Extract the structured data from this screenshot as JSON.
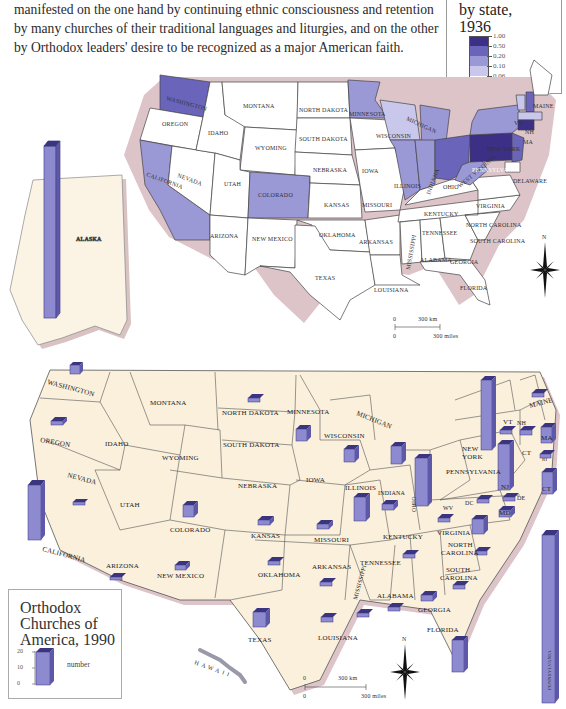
{
  "intro_text": [
    "manifested on the one hand by continuing ethnic consciousness and retention",
    "by many churches of their traditional languages and liturgies, and on the other",
    "by Orthodox leaders' desire to be recognized as a major American faith."
  ],
  "map_1936": {
    "legend": {
      "title_line1": "by state,",
      "title_line2": "1936",
      "breaks": [
        "1.00",
        "0.50",
        "0.20",
        "0.10",
        "0.06",
        "0.00"
      ],
      "colors": [
        "#3b2f86",
        "#6a64bb",
        "#9b98d6",
        "#c9c8ec",
        "#ffffff"
      ]
    },
    "states": [
      {
        "name": "WASHINGTON",
        "class": "0.50-1.00"
      },
      {
        "name": "OREGON",
        "class": "0.00-0.06"
      },
      {
        "name": "CALIFORNIA",
        "class": "0.20-0.50"
      },
      {
        "name": "NEVADA",
        "class": "0.00-0.06"
      },
      {
        "name": "IDAHO",
        "class": "0.00-0.06"
      },
      {
        "name": "MONTANA",
        "class": "0.00-0.06"
      },
      {
        "name": "WYOMING",
        "class": "0.00-0.06"
      },
      {
        "name": "UTAH",
        "class": "0.00-0.06"
      },
      {
        "name": "ARIZONA",
        "class": "0.00-0.06"
      },
      {
        "name": "NEW MEXICO",
        "class": "0.00-0.06"
      },
      {
        "name": "COLORADO",
        "class": "0.10-0.20"
      },
      {
        "name": "NORTH DAKOTA",
        "class": "0.00-0.06"
      },
      {
        "name": "SOUTH DAKOTA",
        "class": "0.00-0.06"
      },
      {
        "name": "NEBRASKA",
        "class": "0.00-0.06"
      },
      {
        "name": "KANSAS",
        "class": "0.00-0.06"
      },
      {
        "name": "OKLAHOMA",
        "class": "0.00-0.06"
      },
      {
        "name": "TEXAS",
        "class": "0.00-0.06"
      },
      {
        "name": "MINNESOTA",
        "class": "0.10-0.20"
      },
      {
        "name": "IOWA",
        "class": "0.00-0.06"
      },
      {
        "name": "MISSOURI",
        "class": "0.00-0.06"
      },
      {
        "name": "ARKANSAS",
        "class": "0.00-0.06"
      },
      {
        "name": "LOUISIANA",
        "class": "0.00-0.06"
      },
      {
        "name": "WISCONSIN",
        "class": "0.06-0.10"
      },
      {
        "name": "ILLINOIS",
        "class": "0.10-0.20"
      },
      {
        "name": "MICHIGAN",
        "class": "0.10-0.20"
      },
      {
        "name": "INDIANA",
        "class": "0.10-0.20"
      },
      {
        "name": "OHIO",
        "class": "0.20-0.50"
      },
      {
        "name": "KENTUCKY",
        "class": "0.00-0.06"
      },
      {
        "name": "TENNESSEE",
        "class": "0.00-0.06"
      },
      {
        "name": "MISSISSIPPI",
        "class": "0.00-0.06"
      },
      {
        "name": "ALABAMA",
        "class": "0.00-0.06"
      },
      {
        "name": "GEORGIA",
        "class": "0.00-0.06"
      },
      {
        "name": "FLORIDA",
        "class": "0.00-0.06"
      },
      {
        "name": "SOUTH CAROLINA",
        "class": "0.00-0.06"
      },
      {
        "name": "NORTH CAROLINA",
        "class": "0.00-0.06"
      },
      {
        "name": "VIRGINIA",
        "class": "0.00-0.06"
      },
      {
        "name": "WEST VIRGINIA",
        "class": "0.10-0.20"
      },
      {
        "name": "PENNSYLVANIA",
        "class": "0.50-1.00"
      },
      {
        "name": "NEW YORK",
        "class": "0.10-0.20"
      },
      {
        "name": "NEW JERSEY",
        "class": "0.20-0.50"
      },
      {
        "name": "DELAWARE",
        "class": "0.00-0.06"
      },
      {
        "name": "MD",
        "class": "0.00-0.06"
      },
      {
        "name": "VT",
        "class": "0.06-0.10"
      },
      {
        "name": "NH",
        "class": "0.20-0.50"
      },
      {
        "name": "MA",
        "class": "0.06-0.10"
      },
      {
        "name": "CT",
        "class": "0.50-1.00"
      },
      {
        "name": "RI",
        "class": "0.00-0.06"
      },
      {
        "name": "MAINE",
        "class": "0.00-0.06"
      },
      {
        "name": "ALASKA",
        "class": "bar"
      }
    ],
    "scale": {
      "km_label": "300 km",
      "miles_label": "300 miles",
      "zero": "0"
    },
    "compass": "N"
  },
  "map_1990": {
    "legend": {
      "title_line1": "Orthodox",
      "title_line2": "Churches of",
      "title_line3": "America, 1990",
      "axis_ticks": [
        "20",
        "10",
        "0"
      ],
      "bar_label": "number"
    },
    "states": [
      {
        "name": "WASHINGTON",
        "bar": 3
      },
      {
        "name": "OREGON",
        "bar": 1
      },
      {
        "name": "CALIFORNIA",
        "bar": 14
      },
      {
        "name": "NEVADA",
        "bar": 1
      },
      {
        "name": "IDAHO",
        "bar": 0
      },
      {
        "name": "MONTANA",
        "bar": 0
      },
      {
        "name": "WYOMING",
        "bar": 0
      },
      {
        "name": "UTAH",
        "bar": 0
      },
      {
        "name": "COLORADO",
        "bar": 3
      },
      {
        "name": "ARIZONA",
        "bar": 1
      },
      {
        "name": "NEW MEXICO",
        "bar": 2
      },
      {
        "name": "NORTH DAKOTA",
        "bar": 1
      },
      {
        "name": "SOUTH DAKOTA",
        "bar": 0
      },
      {
        "name": "NEBRASKA",
        "bar": 0
      },
      {
        "name": "KANSAS",
        "bar": 2
      },
      {
        "name": "OKLAHOMA",
        "bar": 1
      },
      {
        "name": "TEXAS",
        "bar": 4
      },
      {
        "name": "MINNESOTA",
        "bar": 4
      },
      {
        "name": "IOWA",
        "bar": 0
      },
      {
        "name": "MISSOURI",
        "bar": 2
      },
      {
        "name": "ARKANSAS",
        "bar": 1
      },
      {
        "name": "LOUISIANA",
        "bar": 2
      },
      {
        "name": "WISCONSIN",
        "bar": 4
      },
      {
        "name": "MICHIGAN",
        "bar": 5
      },
      {
        "name": "ILLINOIS",
        "bar": 7
      },
      {
        "name": "INDIANA",
        "bar": 2
      },
      {
        "name": "OHIO",
        "bar": 12
      },
      {
        "name": "KENTUCKY",
        "bar": 0
      },
      {
        "name": "TENNESSEE",
        "bar": 1
      },
      {
        "name": "MISSISSIPPI",
        "bar": 1
      },
      {
        "name": "ALABAMA",
        "bar": 1
      },
      {
        "name": "GEORGIA",
        "bar": 2
      },
      {
        "name": "FLORIDA",
        "bar": 8
      },
      {
        "name": "SOUTH CAROLINA",
        "bar": 1
      },
      {
        "name": "NORTH CAROLINA",
        "bar": 1
      },
      {
        "name": "VIRGINIA",
        "bar": 4
      },
      {
        "name": "WV",
        "bar": 1
      },
      {
        "name": "DC",
        "bar": 1
      },
      {
        "name": "PENNSYLVANIA",
        "bar": 56
      },
      {
        "name": "NEW YORK",
        "bar": 19
      },
      {
        "name": "NJ",
        "bar": 13
      },
      {
        "name": "MD",
        "bar": 2
      },
      {
        "name": "DE",
        "bar": 1
      },
      {
        "name": "VT",
        "bar": 1
      },
      {
        "name": "NH",
        "bar": 2
      },
      {
        "name": "MA",
        "bar": 5
      },
      {
        "name": "RI",
        "bar": 1
      },
      {
        "name": "CT",
        "bar": 6
      },
      {
        "name": "MAINE",
        "bar": 1
      },
      {
        "name": "ALASKA",
        "bar": 80
      },
      {
        "name": "HAWAII",
        "bar": 0
      }
    ],
    "scale": {
      "km_label": "300 km",
      "miles_label": "300 miles",
      "zero": "0"
    },
    "compass": "N"
  },
  "labels_1936": {
    "washington": "WASHINGTON",
    "oregon": "OREGON",
    "california": "CALIFORNIA",
    "nevada": "NEVADA",
    "idaho": "IDAHO",
    "montana": "MONTANA",
    "wyoming": "WYOMING",
    "utah": "UTAH",
    "arizona": "ARIZONA",
    "new_mexico": "NEW MEXICO",
    "colorado": "COLORADO",
    "north_dakota": "NORTH DAKOTA",
    "south_dakota": "SOUTH DAKOTA",
    "nebraska": "NEBRASKA",
    "kansas": "KANSAS",
    "oklahoma": "OKLAHOMA",
    "texas": "TEXAS",
    "minnesota": "MINNESOTA",
    "iowa": "IOWA",
    "missouri": "MISSOURI",
    "arkansas": "ARKANSAS",
    "louisiana": "LOUISIANA",
    "wisconsin": "WISCONSIN",
    "michigan": "MICHIGAN",
    "illinois": "ILLINOIS",
    "indiana": "INDIANA",
    "ohio": "OHIO",
    "kentucky": "KENTUCKY",
    "tennessee": "TENNESSEE",
    "mississippi": "MISSISSIPPI",
    "alabama": "ALABAMA",
    "georgia": "GEORGIA",
    "florida": "FLORIDA",
    "south_carolina": "SOUTH CAROLINA",
    "north_carolina": "NORTH CAROLINA",
    "virginia": "VIRGINIA",
    "west_virginia": "WEST VIRGINIA",
    "pennsylvania": "PENNSYLVANIA",
    "new_york": "NEW YORK",
    "delaware": "DELAWARE",
    "maine": "MAINE",
    "vt": "VT",
    "nh": "NH",
    "ma": "MA",
    "alaska": "ALASKA"
  },
  "labels_1990": {
    "washington": "WASHINGTON",
    "oregon": "OREGON",
    "california": "CALIFORNIA",
    "nevada": "NEVADA",
    "idaho": "IDAHO",
    "montana": "MONTANA",
    "wyoming": "WYOMING",
    "utah": "UTAH",
    "arizona": "ARIZONA",
    "new_mexico": "NEW MEXICO",
    "colorado": "COLORADO",
    "north_dakota": "NORTH DAKOTA",
    "south_dakota": "SOUTH DAKOTA",
    "nebraska": "NEBRASKA",
    "kansas": "KANSAS",
    "oklahoma": "OKLAHOMA",
    "texas": "TEXAS",
    "minnesota": "MINNESOTA",
    "iowa": "IOWA",
    "missouri": "MISSOURI",
    "arkansas": "ARKANSAS",
    "louisiana": "LOUISIANA",
    "wisconsin": "WISCONSIN",
    "michigan": "MICHIGAN",
    "illinois": "ILLINOIS",
    "indiana": "INDIANA",
    "ohio": "OHIO",
    "kentucky": "KENTUCKY",
    "tennessee": "TENNESSEE",
    "mississippi": "MISSISSIPPI",
    "alabama": "ALABAMA",
    "georgia": "GEORGIA",
    "florida": "FLORIDA",
    "south_carolina_1": "SOUTH",
    "south_carolina_2": "CAROLINA",
    "north_carolina_1": "NORTH",
    "north_carolina_2": "CAROLINA",
    "virginia": "VIRGINIA",
    "wv": "WV",
    "dc": "DC",
    "pennsylvania": "PENNSYLVANIA",
    "new_york_1": "NEW",
    "new_york_2": "YORK",
    "nj": "NJ",
    "md": "MD",
    "de": "DE",
    "vt": "VT",
    "nh": "NH",
    "ma": "MA",
    "ri": "RI",
    "ct_small": "CT",
    "ct_big": "CT",
    "maine": "MAINE",
    "hawaii": "HAWAII",
    "alaska_bar": "PENNSYLVANIA"
  }
}
